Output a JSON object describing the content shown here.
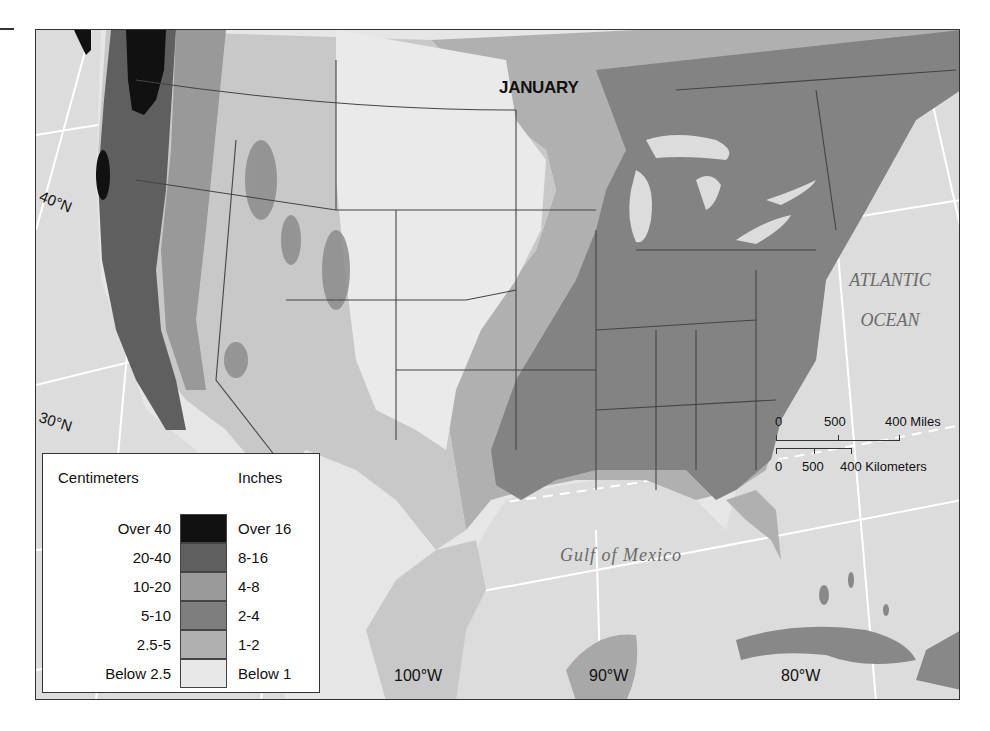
{
  "map": {
    "title": "JANUARY",
    "latitude_labels": [
      "40°N",
      "30°N"
    ],
    "longitude_labels": [
      "100°W",
      "90°W",
      "80°W"
    ],
    "water_labels": {
      "atlantic_line1": "ATLANTIC",
      "atlantic_line2": "OCEAN",
      "gulf": "Gulf of Mexico"
    },
    "colors": {
      "water": "#dcdcdc",
      "over_16": "#111111",
      "r8_16": "#5f5f5f",
      "r4_8": "#9a9a9a",
      "r2_4": "#838383",
      "r1_2": "#b0b0b0",
      "below_1": "#e6e6e6",
      "border": "#444444",
      "graticule": "#ffffff"
    }
  },
  "legend": {
    "left_header": "Centimeters",
    "right_header": "Inches",
    "rows": [
      {
        "cm": "Over 40",
        "in": "Over 16",
        "color": "#111111"
      },
      {
        "cm": "20-40",
        "in": "8-16",
        "color": "#5f5f5f"
      },
      {
        "cm": "10-20",
        "in": "4-8",
        "color": "#9a9a9a"
      },
      {
        "cm": "5-10",
        "in": "2-4",
        "color": "#7e7e7e"
      },
      {
        "cm": "2.5-5",
        "in": "1-2",
        "color": "#b0b0b0"
      },
      {
        "cm": "Below 2.5",
        "in": "Below 1",
        "color": "#e8e8e8"
      }
    ]
  },
  "scale": {
    "miles": {
      "ticks": [
        "0",
        "500",
        "400 Miles"
      ]
    },
    "kilometers": {
      "ticks": [
        "0",
        "500",
        "400 Kilometers"
      ]
    }
  }
}
